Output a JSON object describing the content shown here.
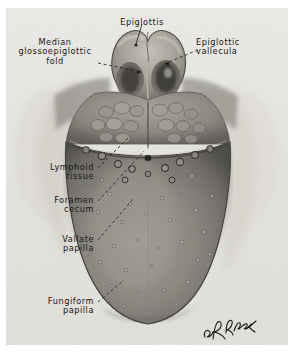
{
  "figure": {
    "kind": "anatomical-illustration",
    "background_color": "#e8e8e6",
    "ink_color": "#171717",
    "page_color": "#ffffff",
    "signature": "R.Drake"
  },
  "labels": [
    {
      "id": "epiglottis",
      "text": "Epiglottis",
      "x": 104,
      "y": 10,
      "width": 76,
      "align": "center",
      "leader": {
        "from": [
          142,
          22
        ],
        "to": [
          135,
          41
        ],
        "style": "solid"
      }
    },
    {
      "id": "median-glossoepiglottic-fold",
      "text": "Median\nglossoepiglottic\nfold",
      "x": 6,
      "y": 30,
      "width": 98,
      "align": "center",
      "leader": {
        "from": [
          95,
          60
        ],
        "to": [
          140,
          70
        ],
        "style": "dashed"
      }
    },
    {
      "id": "epiglottic-vallecula",
      "text": "Epiglottic\nvallecula",
      "x": 196,
      "y": 30,
      "width": 90,
      "align": "left",
      "leader": {
        "from": [
          196,
          48
        ],
        "to": [
          163,
          62
        ],
        "style": "dashed"
      }
    },
    {
      "id": "lymphoid-tissue",
      "text": "Lymphoid\ntissue",
      "x": 14,
      "y": 160,
      "width": 80,
      "align": "right",
      "leader": {
        "from": [
          96,
          166
        ],
        "to": [
          128,
          135
        ],
        "style": "dashed"
      }
    },
    {
      "id": "foramen-cecum",
      "text": "Foramen\ncecum",
      "x": 20,
      "y": 193,
      "width": 74,
      "align": "right",
      "leader": {
        "from": [
          96,
          199
        ],
        "to": [
          142,
          148
        ],
        "style": "dashed"
      }
    },
    {
      "id": "vallate-papilla",
      "text": "Vallate\npapilla",
      "x": 24,
      "y": 232,
      "width": 70,
      "align": "right",
      "leader": {
        "from": [
          96,
          238
        ],
        "to": [
          133,
          196
        ],
        "style": "dashed"
      }
    },
    {
      "id": "fungiform-papilla",
      "text": "Fungiform\npapilla",
      "x": 14,
      "y": 300,
      "width": 80,
      "align": "right",
      "leader": {
        "from": [
          96,
          303
        ],
        "to": [
          122,
          279
        ],
        "style": "dashed"
      }
    }
  ]
}
